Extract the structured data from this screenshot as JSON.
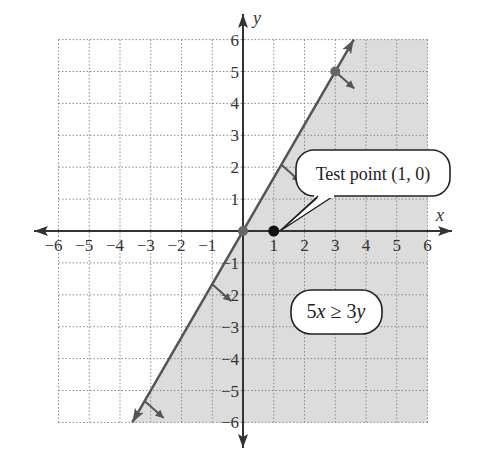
{
  "chart_data": {
    "type": "line",
    "title": "",
    "xlabel": "x",
    "ylabel": "y",
    "xlim": [
      -6,
      6
    ],
    "ylim": [
      -6,
      6
    ],
    "grid": true,
    "x_ticks": [
      -6,
      -5,
      -4,
      -3,
      -2,
      -1,
      1,
      2,
      3,
      4,
      5,
      6
    ],
    "y_ticks": [
      -6,
      -5,
      -4,
      -3,
      -2,
      -1,
      1,
      2,
      3,
      4,
      5,
      6
    ],
    "x_tick_labels": [
      "−6",
      "−5",
      "−4",
      "−3",
      "−2",
      "−1",
      "1",
      "2",
      "3",
      "4",
      "5",
      "6"
    ],
    "y_tick_labels": [
      "−6",
      "−5",
      "−4",
      "−3",
      "−2",
      "−1",
      "1",
      "2",
      "3",
      "4",
      "5",
      "6"
    ],
    "series": [
      {
        "name": "boundary line 5x = 3y",
        "kind": "line",
        "equation": "y = (5/3)x",
        "x": [
          -3.6,
          0,
          3,
          3.6
        ],
        "y": [
          -6,
          0,
          5,
          6
        ],
        "color": "#555555"
      },
      {
        "name": "points on boundary",
        "kind": "scatter",
        "x": [
          0,
          3
        ],
        "y": [
          0,
          5
        ],
        "color": "#666666"
      },
      {
        "name": "test point",
        "kind": "scatter",
        "x": [
          1
        ],
        "y": [
          0
        ],
        "color": "#111111"
      }
    ],
    "shaded_region": {
      "inequality": "5x ≥ 3y",
      "side": "right of / below boundary line",
      "color": "#dcdcdc"
    },
    "annotations": [
      {
        "text": "Test point (1, 0)",
        "points_to": [
          1,
          0
        ]
      },
      {
        "text": "5x ≥ 3y",
        "position": [
          3,
          -2.5
        ]
      }
    ]
  },
  "labels": {
    "x_axis": "x",
    "y_axis": "y",
    "test_point_callout": "Test point (1, 0)",
    "inequality_parts": {
      "lead": "5",
      "x": "x",
      "rel": " ≥ 3",
      "y": "y"
    }
  },
  "colors": {
    "shade": "#dcdcdc",
    "grid": "#8a8a8a",
    "axis": "#333333",
    "line": "#555555",
    "boundary_point": "#666666",
    "test_point": "#111111"
  }
}
